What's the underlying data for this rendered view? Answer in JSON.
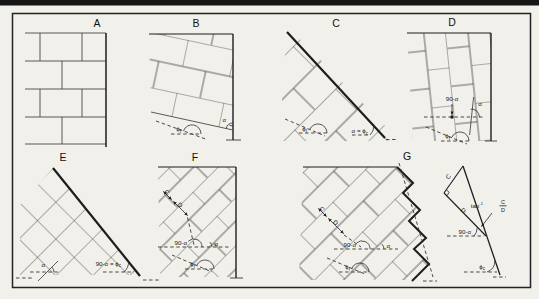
{
  "colors": {
    "paper": "#f2f0ea",
    "ink": "#1d1d1d",
    "joint": "#3f3f3f",
    "bar": "#161616"
  },
  "panels": {
    "a": "A",
    "b": "B",
    "c": "C",
    "d": "D",
    "e": "E",
    "f": "F",
    "g": "G"
  },
  "sym": {
    "alpha": "α",
    "phi": "ϕ",
    "sub_f": "f",
    "sub_c": "c",
    "n90": "90-α",
    "eq": " = ",
    "cap_c": "C",
    "cap_d": "D",
    "tan": "tan",
    "sup_minus_one": "-1"
  }
}
